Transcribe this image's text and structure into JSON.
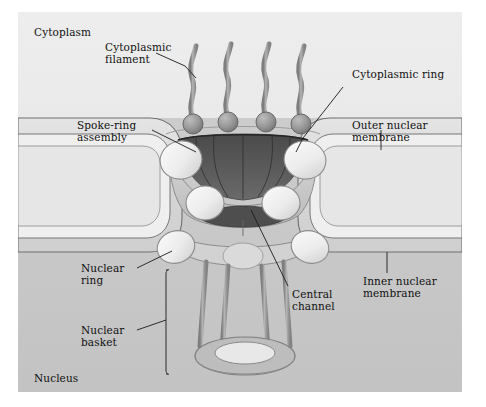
{
  "figure": {
    "type": "biological-schematic",
    "palette": {
      "page_background": "#ffffff",
      "cytoplasm": "#e8e8e8",
      "nucleoplasm": "#c9c9c9",
      "membrane_band": "#dcdcdc",
      "membrane_line": "#6f6f6f",
      "pore_funnel_dark": "#555555",
      "central_channel_dark": "#4e4e4e",
      "ring_highlight": "#f2f2f2",
      "filament_gray": "#9b9b9b",
      "sphere_gray": "#8f8f8f",
      "label_text": "#101010",
      "leader_line": "#1a1a1a"
    },
    "counts": {
      "cytoplasmic_filaments": 4,
      "basket_filaments": 4,
      "cytoplasmic_ring_lobes": 3,
      "nuclear_ring_lobes": 3
    }
  },
  "compartments": [
    {
      "id": "cytoplasm",
      "label": "Cytoplasm"
    },
    {
      "id": "nucleus",
      "label": "Nucleus"
    }
  ],
  "labels": [
    {
      "id": "cytoplasmic-filament",
      "text": "Cytoplasmic\nfilament"
    },
    {
      "id": "spoke-ring-assembly",
      "text": "Spoke-ring\nassembly"
    },
    {
      "id": "nuclear-ring",
      "text": "Nuclear\nring"
    },
    {
      "id": "nuclear-basket",
      "text": "Nuclear\nbasket"
    },
    {
      "id": "cytoplasmic-ring",
      "text": "Cytoplasmic ring"
    },
    {
      "id": "outer-nuclear-membrane",
      "text": "Outer nuclear\nmembrane"
    },
    {
      "id": "inner-nuclear-membrane",
      "text": "Inner nuclear\nmembrane"
    },
    {
      "id": "central-channel",
      "text": "Central\nchannel"
    }
  ],
  "label_lines": {
    "cytoplasmic_filament_l1": "Cytoplasmic",
    "cytoplasmic_filament_l2": "filament",
    "spoke_ring_l1": "Spoke-ring",
    "spoke_ring_l2": "assembly",
    "nuclear_ring_l1": "Nuclear",
    "nuclear_ring_l2": "ring",
    "nuclear_basket_l1": "Nuclear",
    "nuclear_basket_l2": "basket",
    "cytoplasmic_ring": "Cytoplasmic ring",
    "outer_membrane_l1": "Outer nuclear",
    "outer_membrane_l2": "membrane",
    "inner_membrane_l1": "Inner nuclear",
    "inner_membrane_l2": "membrane",
    "central_channel_l1": "Central",
    "central_channel_l2": "channel",
    "cytoplasm": "Cytoplasm",
    "nucleus": "Nucleus"
  }
}
